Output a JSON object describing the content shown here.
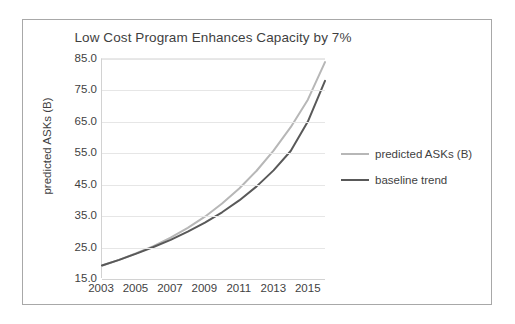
{
  "chart_data": {
    "type": "line",
    "title": "Low Cost Program Enhances Capacity by 7%",
    "xlabel": "",
    "ylabel": "predicted ASKs (B)",
    "x": [
      2003,
      2004,
      2005,
      2006,
      2007,
      2008,
      2009,
      2010,
      2011,
      2012,
      2013,
      2014,
      2015,
      2016
    ],
    "x_tick_labels": [
      "2003",
      "2005",
      "2007",
      "2009",
      "2011",
      "2013",
      "2015"
    ],
    "x_tick_values": [
      2003,
      2005,
      2007,
      2009,
      2011,
      2013,
      2015
    ],
    "xlim": [
      2003,
      2016
    ],
    "y_tick_labels": [
      "15.0",
      "25.0",
      "35.0",
      "45.0",
      "55.0",
      "65.0",
      "75.0",
      "85.0"
    ],
    "y_tick_values": [
      15.0,
      25.0,
      35.0,
      45.0,
      55.0,
      65.0,
      75.0,
      85.0
    ],
    "ylim": [
      15.0,
      85.0
    ],
    "grid": true,
    "legend_position": "right",
    "series": [
      {
        "name": "predicted ASKs (B)",
        "color": "#b7b7b7",
        "values": [
          19.0,
          20.8,
          22.9,
          25.2,
          27.9,
          31.0,
          34.6,
          38.8,
          43.6,
          49.2,
          55.7,
          63.2,
          72.0,
          84.0
        ]
      },
      {
        "name": "baseline trend",
        "color": "#595959",
        "values": [
          19.0,
          20.8,
          22.8,
          24.9,
          27.2,
          29.8,
          32.7,
          36.0,
          39.8,
          44.2,
          49.4,
          55.6,
          65.0,
          78.0
        ]
      }
    ]
  },
  "legend": {
    "entries": [
      {
        "label": "predicted ASKs (B)",
        "color": "#b7b7b7"
      },
      {
        "label": "baseline trend",
        "color": "#595959"
      }
    ]
  },
  "colors": {
    "predicted_line": "#b7b7b7",
    "baseline_line": "#595959",
    "gridline": "#e6e6e6",
    "axis": "#d2d2d2",
    "text": "#3f3f3f",
    "frame_border": "#a8a8a8"
  }
}
